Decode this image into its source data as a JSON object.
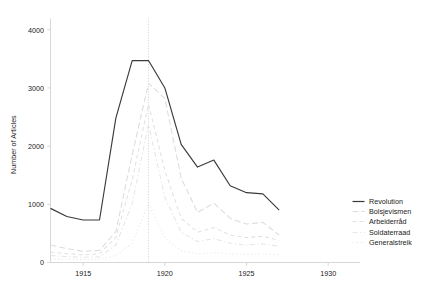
{
  "chart_data": {
    "type": "line",
    "title": "",
    "xlabel": "",
    "ylabel": "Number of Articles",
    "xlim": [
      1913.0,
      1930.6
    ],
    "ylim": [
      0,
      4150
    ],
    "grid": false,
    "legend_position": "right",
    "xticks": [
      1915,
      1920,
      1925,
      1930
    ],
    "xtick_labels": [
      "1915",
      "1920",
      "1925",
      "1930"
    ],
    "yticks": [
      0,
      1000,
      2000,
      3000,
      4000
    ],
    "ytick_labels": [
      "0",
      "1000",
      "2000",
      "3000",
      "4000"
    ],
    "annotations": [
      {
        "name": "revolution-year-marker",
        "type": "vline",
        "x": 1919,
        "style": "dotted",
        "color": "#c8c8c8"
      }
    ],
    "x": [
      1913,
      1914,
      1915,
      1916,
      1917,
      1918,
      1919,
      1920,
      1921,
      1922,
      1923,
      1924,
      1925,
      1926,
      1927
    ],
    "series": [
      {
        "name": "Revolution",
        "color": "#3a3a3a",
        "dash": "solid",
        "width": 1.15,
        "values": [
          930,
          790,
          730,
          730,
          2480,
          3470,
          3470,
          3000,
          2030,
          1640,
          1760,
          1320,
          1200,
          1180,
          900
        ]
      },
      {
        "name": "Bolsjevismen",
        "color": "#dcdcdc",
        "dash": "dashed-long",
        "width": 1.05,
        "values": [
          300,
          240,
          190,
          210,
          530,
          1850,
          3080,
          2820,
          1450,
          860,
          1020,
          760,
          660,
          690,
          470
        ]
      },
      {
        "name": "Arbeiderråd",
        "color": "#e2e2e2",
        "dash": "dashed-short",
        "width": 1.05,
        "values": [
          180,
          150,
          130,
          150,
          430,
          1420,
          2720,
          1580,
          760,
          520,
          600,
          470,
          430,
          450,
          380
        ]
      },
      {
        "name": "Soldaterraad",
        "color": "#e6e6e6",
        "dash": "dashdot",
        "width": 1.05,
        "values": [
          120,
          100,
          90,
          95,
          300,
          1010,
          2380,
          1120,
          520,
          360,
          410,
          330,
          300,
          320,
          280
        ]
      },
      {
        "name": "Generalstreik",
        "color": "#ececec",
        "dash": "dotted",
        "width": 1.05,
        "values": [
          60,
          55,
          50,
          55,
          120,
          330,
          1020,
          420,
          200,
          150,
          170,
          150,
          140,
          150,
          130
        ]
      }
    ]
  },
  "legend": {
    "items": [
      {
        "label": "Revolution"
      },
      {
        "label": "Bolsjevismen"
      },
      {
        "label": "Arbeiderråd"
      },
      {
        "label": "Soldaterraad"
      },
      {
        "label": "Generalstreik"
      }
    ]
  },
  "caption": {
    "text": ""
  }
}
